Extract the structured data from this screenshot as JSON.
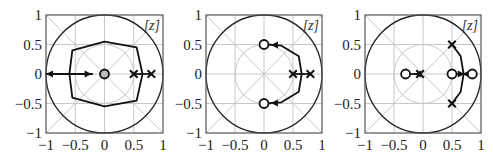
{
  "chart_data": [
    {
      "type": "scatter",
      "title": "",
      "plane_label": "[z]",
      "xlabel": "",
      "ylabel": "",
      "xlim": [
        -1,
        1
      ],
      "ylim": [
        -1,
        1
      ],
      "xticks": [
        "−1",
        "−0.5",
        "0",
        "0.5",
        "1"
      ],
      "yticks": [
        "1",
        "0.5",
        "0",
        "−0.5",
        "−1"
      ],
      "grid": true,
      "unit_circle": true,
      "poles": [
        [
          0.5,
          0
        ],
        [
          0.8,
          0
        ]
      ],
      "zeros": [
        [
          0,
          0
        ]
      ],
      "loci": [
        {
          "desc": "closed contour around origin",
          "points": [
            [
              -0.6,
              0
            ],
            [
              -0.55,
              0.4
            ],
            [
              0,
              0.55
            ],
            [
              0.55,
              0.45
            ],
            [
              0.65,
              0
            ],
            [
              0.55,
              -0.45
            ],
            [
              0,
              -0.55
            ],
            [
              -0.55,
              -0.4
            ],
            [
              -0.6,
              0
            ]
          ]
        },
        {
          "desc": "arrow along real axis from origin to -1",
          "points": [
            [
              -1,
              0
            ],
            [
              -0.2,
              0
            ]
          ],
          "bidirectional": true
        },
        {
          "desc": "segment between poles",
          "points": [
            [
              0.5,
              0
            ],
            [
              0.8,
              0
            ]
          ]
        }
      ]
    },
    {
      "type": "scatter",
      "title": "",
      "plane_label": "[z]",
      "xlabel": "",
      "ylabel": "",
      "xlim": [
        -1,
        1
      ],
      "ylim": [
        -1,
        1
      ],
      "xticks": [
        "−1",
        "−0.5",
        "0",
        "0.5",
        "1"
      ],
      "yticks": [
        "1",
        "0.5",
        "0",
        "−0.5",
        "−1"
      ],
      "grid": true,
      "unit_circle": true,
      "poles": [
        [
          0.5,
          0
        ],
        [
          0.8,
          0
        ]
      ],
      "zeros": [
        [
          0,
          0.5
        ],
        [
          0,
          -0.5
        ]
      ],
      "loci": [
        {
          "desc": "segment between poles",
          "points": [
            [
              0.5,
              0
            ],
            [
              0.8,
              0
            ]
          ]
        },
        {
          "desc": "upper branch to zero at 0.5j",
          "points": [
            [
              0.65,
              0
            ],
            [
              0.6,
              0.3
            ],
            [
              0.3,
              0.48
            ],
            [
              0.05,
              0.5
            ]
          ]
        },
        {
          "desc": "lower branch to zero at -0.5j",
          "points": [
            [
              0.65,
              0
            ],
            [
              0.6,
              -0.3
            ],
            [
              0.3,
              -0.48
            ],
            [
              0.05,
              -0.5
            ]
          ]
        }
      ]
    },
    {
      "type": "scatter",
      "title": "",
      "plane_label": "[z]",
      "xlabel": "",
      "ylabel": "",
      "xlim": [
        -1,
        1
      ],
      "ylim": [
        -1,
        1
      ],
      "xticks": [
        "−1",
        "−0.5",
        "0",
        "0.5",
        "1"
      ],
      "yticks": [
        "1",
        "0.5",
        "0",
        "−0.5",
        "−1"
      ],
      "grid": true,
      "unit_circle": true,
      "poles": [
        [
          -0.05,
          0
        ],
        [
          0.5,
          0.5
        ],
        [
          0.5,
          -0.5
        ]
      ],
      "zeros": [
        [
          -0.3,
          0
        ],
        [
          0.5,
          0
        ],
        [
          0.85,
          0
        ]
      ],
      "loci": [
        {
          "desc": "pole near origin to zero at -0.3",
          "points": [
            [
              -0.05,
              0
            ],
            [
              -0.3,
              0
            ]
          ]
        },
        {
          "desc": "upper pole arc to real axis",
          "points": [
            [
              0.5,
              0.5
            ],
            [
              0.65,
              0.3
            ],
            [
              0.7,
              0
            ]
          ]
        },
        {
          "desc": "lower pole arc to real axis",
          "points": [
            [
              0.5,
              -0.5
            ],
            [
              0.65,
              -0.3
            ],
            [
              0.7,
              0
            ]
          ]
        },
        {
          "desc": "real-axis breakaway between zeros",
          "points": [
            [
              0.5,
              0
            ],
            [
              0.85,
              0
            ]
          ]
        }
      ]
    }
  ]
}
